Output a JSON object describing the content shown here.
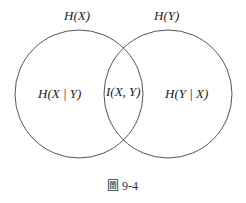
{
  "diagram": {
    "type": "venn",
    "labels": {
      "hx": "H(X)",
      "hy": "H(Y)",
      "hx_given_y": "H(X | Y)",
      "ixy": "I(X, Y)",
      "hy_given_x": "H(Y | X)"
    },
    "caption": "圖 9-4",
    "colors": {
      "stroke": "#555555",
      "text": "#222222"
    }
  }
}
